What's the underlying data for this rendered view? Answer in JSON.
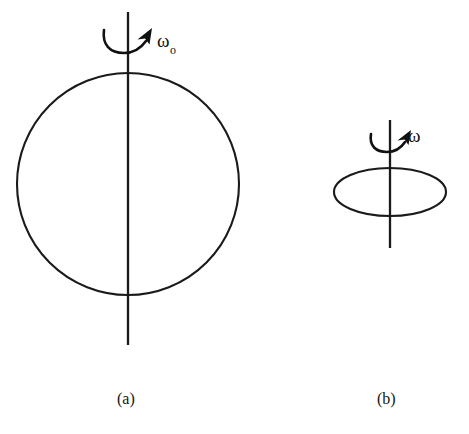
{
  "figure": {
    "background_color": "#ffffff",
    "ink_color": "#1a1a1a",
    "width": 469,
    "height": 434
  },
  "panels": [
    {
      "id": "panel-a",
      "caption": "(a)",
      "body_shape": "circle",
      "body_label": "sphere",
      "angular_velocity_label": "ω",
      "angular_velocity_subscript": "o",
      "angular_velocity_full": "ωo",
      "rotation_sense": "counterclockwise-viewed-from-top",
      "geometry": {
        "center_x": 128,
        "center_y": 184,
        "radius": 111,
        "axis_top_y": 12,
        "axis_bottom_y": 345
      }
    },
    {
      "id": "panel-b",
      "caption": "(b)",
      "body_shape": "ellipse",
      "body_label": "disk",
      "angular_velocity_label": "ω",
      "angular_velocity_subscript": "",
      "angular_velocity_full": "ω",
      "rotation_sense": "counterclockwise-viewed-from-top",
      "geometry": {
        "center_x": 390,
        "center_y": 192,
        "radius_x": 56,
        "radius_y": 24,
        "axis_top_y": 120,
        "axis_bottom_y": 248
      }
    }
  ],
  "icons": {
    "rotation_arrow": "curved-rotation-arrow-icon",
    "axis": "vertical-axis-icon"
  }
}
